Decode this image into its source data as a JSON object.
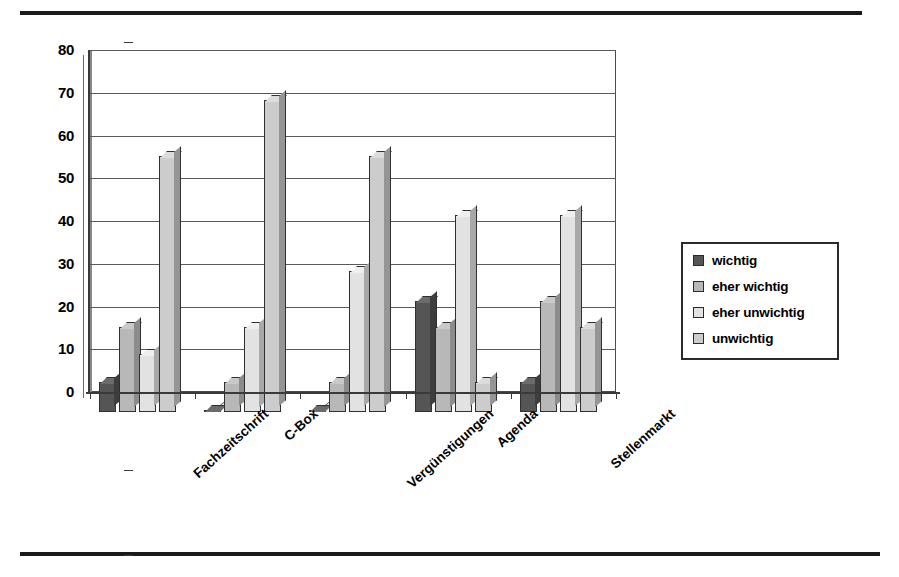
{
  "chart_data": {
    "type": "bar",
    "title": "",
    "subtitle": "",
    "xlabel": "",
    "ylabel": "",
    "ylim": [
      0,
      80
    ],
    "yticks": [
      0,
      10,
      20,
      30,
      40,
      50,
      60,
      70,
      80
    ],
    "grid": "horizontal",
    "legend_position": "right",
    "orientation": "vertical-grouped-3d",
    "categories": [
      "Fachzeitschrift",
      "C-Box",
      "Vergünstigungen",
      "Agenda",
      "Stellenmarkt"
    ],
    "series": [
      {
        "name": "wichtig",
        "color": "#555555",
        "values": [
          7,
          0.5,
          0.5,
          26,
          7
        ]
      },
      {
        "name": "eher wichtig",
        "color": "#b8b8b8",
        "values": [
          20,
          7,
          7,
          20,
          26
        ]
      },
      {
        "name": "eher unwichtig",
        "color": "#e2e2e2",
        "values": [
          13.5,
          20,
          33,
          46,
          46
        ]
      },
      {
        "name": "unwichtig",
        "color": "#cccccc",
        "values": [
          60,
          73,
          60,
          7,
          20
        ]
      }
    ],
    "annotations": []
  },
  "legend": {
    "items": [
      {
        "label": "wichtig"
      },
      {
        "label": "eher wichtig"
      },
      {
        "label": "eher unwichtig"
      },
      {
        "label": "unwichtig"
      }
    ]
  },
  "axis": {
    "y_tick_labels": [
      "80",
      "70",
      "60",
      "50",
      "40",
      "30",
      "20",
      "10",
      "0"
    ]
  }
}
